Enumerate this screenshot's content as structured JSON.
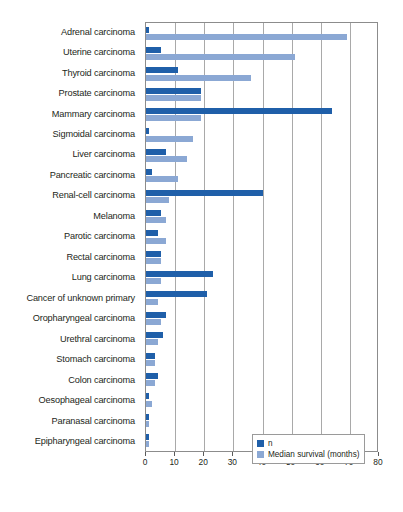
{
  "chart_data": {
    "type": "bar",
    "orientation": "horizontal",
    "title": "",
    "xlabel": "",
    "ylabel": "",
    "xlim": [
      0,
      80
    ],
    "xticks": [
      0,
      10,
      20,
      30,
      40,
      50,
      60,
      70,
      80
    ],
    "grid": true,
    "legend_position": "bottom-right",
    "categories": [
      "Adrenal carcinoma",
      "Uterine carcinoma",
      "Thyroid carcinoma",
      "Prostate carcinoma",
      "Mammary carcinoma",
      "Sigmoidal carcinoma",
      "Liver carcinoma",
      "Pancreatic carcinoma",
      "Renal-cell carcinoma",
      "Melanoma",
      "Parotic carcinoma",
      "Rectal carcinoma",
      "Lung carcinoma",
      "Cancer of unknown primary",
      "Oropharyngeal carcinoma",
      "Urethral carcinoma",
      "Stomach carcinoma",
      "Colon carcinoma",
      "Oesophageal carcinoma",
      "Paranasal carcinoma",
      "Epipharyngeal carcinoma"
    ],
    "series": [
      {
        "name": "n",
        "color": "#1f5fa9",
        "values": [
          1,
          5,
          11,
          19,
          64,
          1,
          7,
          2,
          40,
          5,
          4,
          5,
          23,
          21,
          7,
          6,
          3,
          4,
          1,
          1,
          1
        ]
      },
      {
        "name": "Median survival (months)",
        "color": "#8ba8d4",
        "values": [
          69,
          51,
          36,
          19,
          19,
          16,
          14,
          11,
          8,
          7,
          7,
          5,
          5,
          4,
          5,
          4,
          3,
          3,
          2,
          1,
          1
        ]
      }
    ]
  },
  "legend": {
    "items": [
      {
        "label": "n",
        "color": "#1f5fa9"
      },
      {
        "label": "Median survival (months)",
        "color": "#8ba8d4"
      }
    ]
  }
}
